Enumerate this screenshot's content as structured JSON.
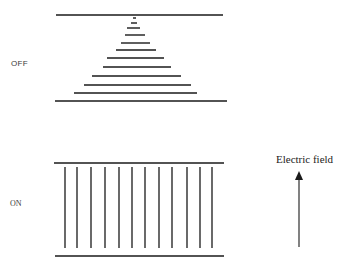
{
  "labels": {
    "off": "OFF",
    "on": "ON",
    "field": "Electric field"
  },
  "colors": {
    "line": "#1a1a1a",
    "text": "#333333"
  },
  "off_state": {
    "top_plate": {
      "x1": 56,
      "x2": 223,
      "y": 15
    },
    "bottom_plate": {
      "x1": 55,
      "x2": 227,
      "y": 101
    },
    "molecules": [
      {
        "x1": 133,
        "x2": 136,
        "y": 18
      },
      {
        "x1": 131,
        "x2": 137,
        "y": 23
      },
      {
        "x1": 127,
        "x2": 140,
        "y": 28
      },
      {
        "x1": 125,
        "x2": 145,
        "y": 35
      },
      {
        "x1": 121,
        "x2": 150,
        "y": 43
      },
      {
        "x1": 116,
        "x2": 156,
        "y": 50
      },
      {
        "x1": 107,
        "x2": 164,
        "y": 58
      },
      {
        "x1": 103,
        "x2": 171,
        "y": 67
      },
      {
        "x1": 92,
        "x2": 181,
        "y": 76
      },
      {
        "x1": 84,
        "x2": 191,
        "y": 85
      },
      {
        "x1": 74,
        "x2": 197,
        "y": 93
      }
    ]
  },
  "on_state": {
    "top_plate": {
      "x1": 54,
      "x2": 224,
      "y": 163
    },
    "bottom_plate": {
      "x1": 55,
      "x2": 224,
      "y": 256
    },
    "molecule_y1": 167,
    "molecule_y2": 248,
    "molecule_xs": [
      65,
      77,
      91,
      105,
      119,
      132,
      145,
      159,
      172,
      187,
      200,
      212
    ]
  },
  "field_arrow": {
    "x": 299,
    "y_tip": 171,
    "y_tail": 247
  }
}
